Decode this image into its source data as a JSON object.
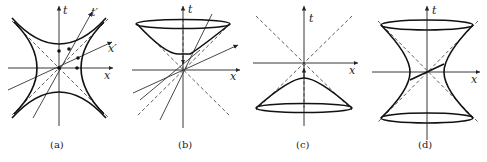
{
  "figure": {
    "panels": [
      {
        "id": "a",
        "caption": "(a)",
        "axis_labels": {
          "t": "t",
          "x": "x",
          "t_prime": "t′",
          "x_prime": "x′"
        }
      },
      {
        "id": "b",
        "caption": "(b)",
        "axis_labels": {
          "t": "t",
          "x": "x"
        }
      },
      {
        "id": "c",
        "caption": "(c)",
        "axis_labels": {
          "t": "t",
          "x": "x"
        }
      },
      {
        "id": "d",
        "caption": "(d)",
        "axis_labels": {
          "t": "t",
          "x": "x"
        }
      }
    ]
  }
}
